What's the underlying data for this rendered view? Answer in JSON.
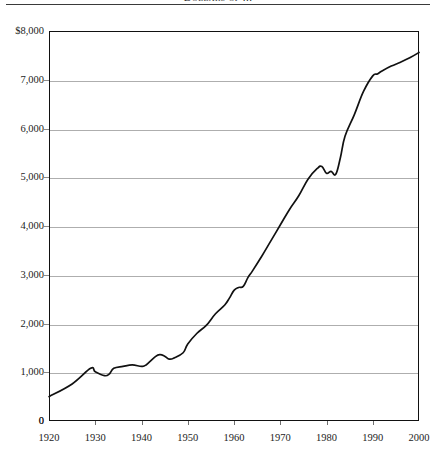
{
  "figure": {
    "title": "Dollars of ...",
    "title_note": "title cropped at top edge of image",
    "background_color": "#ffffff",
    "line_color": "#111111",
    "grid_color": "#aeaeae",
    "axis_color": "#111111"
  },
  "chart_data": {
    "type": "line",
    "title": "Dollars of ...",
    "xlabel": "",
    "ylabel": "",
    "xlim": [
      1920,
      2000
    ],
    "ylim": [
      0,
      8000
    ],
    "grid": true,
    "legend": false,
    "y_ticks": [
      0,
      1000,
      2000,
      3000,
      4000,
      5000,
      6000,
      7000,
      8000
    ],
    "y_tick_labels": [
      "0",
      "1,000",
      "2,000",
      "3,000",
      "4,000",
      "5,000",
      "6,000",
      "7,000",
      "$8,000"
    ],
    "x_ticks": [
      1920,
      1930,
      1940,
      1950,
      1960,
      1970,
      1980,
      1990,
      2000
    ],
    "x_tick_labels": [
      "1920",
      "1930",
      "1940",
      "1950",
      "1960",
      "1970",
      "1980",
      "1990",
      "2000"
    ],
    "series": [
      {
        "name": "Dollars",
        "x": [
          1920,
          1925,
          1929,
          1930,
          1932,
          1933,
          1934,
          1936,
          1938,
          1940,
          1941,
          1943,
          1944,
          1945,
          1946,
          1947,
          1949,
          1950,
          1952,
          1954,
          1956,
          1958,
          1959,
          1960,
          1961,
          1962,
          1963,
          1964,
          1966,
          1968,
          1970,
          1972,
          1974,
          1976,
          1978,
          1979,
          1980,
          1981,
          1982,
          1983,
          1984,
          1986,
          1988,
          1990,
          1991,
          1992,
          1994,
          1996,
          1998,
          2000
        ],
        "y": [
          500,
          760,
          1080,
          1010,
          930,
          960,
          1080,
          1120,
          1150,
          1120,
          1150,
          1320,
          1360,
          1330,
          1270,
          1290,
          1400,
          1580,
          1800,
          1960,
          2200,
          2380,
          2520,
          2680,
          2740,
          2760,
          2940,
          3080,
          3380,
          3700,
          4020,
          4340,
          4620,
          4960,
          5180,
          5220,
          5080,
          5120,
          5060,
          5400,
          5840,
          6280,
          6760,
          7080,
          7120,
          7180,
          7280,
          7360,
          7450,
          7560
        ]
      }
    ]
  },
  "axes": {
    "y_origin_label": "0"
  }
}
